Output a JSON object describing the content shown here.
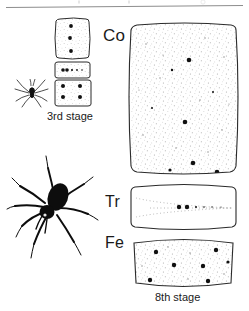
{
  "figure": {
    "background_color": "#ffffff",
    "ink_color": "#1a1a1a",
    "stipple_color": "#9a9a9a",
    "top_rule": {
      "visible": true,
      "color": "#8d8d8d"
    }
  },
  "labels": {
    "coxa": "Co",
    "trochanter": "Tr",
    "femur": "Fe"
  },
  "captions": {
    "left": "3rd stage",
    "right": "8th stage"
  },
  "specimens": [
    {
      "name": "third-stage",
      "caption": "3rd stage",
      "spider_icon": "spider-silhouette-small",
      "segments": [
        {
          "name": "coxa",
          "label": "Co",
          "setae_count": 3,
          "stippled": true
        },
        {
          "name": "trochanter",
          "label": "Tr",
          "setae_count": 4,
          "stippled": true
        },
        {
          "name": "femur",
          "label": "Fe",
          "setae_count": 4,
          "stippled": true
        }
      ]
    },
    {
      "name": "eighth-stage",
      "caption": "8th stage",
      "spider_icon": "spider-silhouette-large",
      "segments": [
        {
          "name": "coxa",
          "label": "Co",
          "setae_count": 6,
          "stippled": true
        },
        {
          "name": "trochanter",
          "label": "Tr",
          "setae_count": 2,
          "stippled": false
        },
        {
          "name": "femur",
          "label": "Fe",
          "setae_count": 7,
          "stippled": true
        }
      ]
    }
  ]
}
